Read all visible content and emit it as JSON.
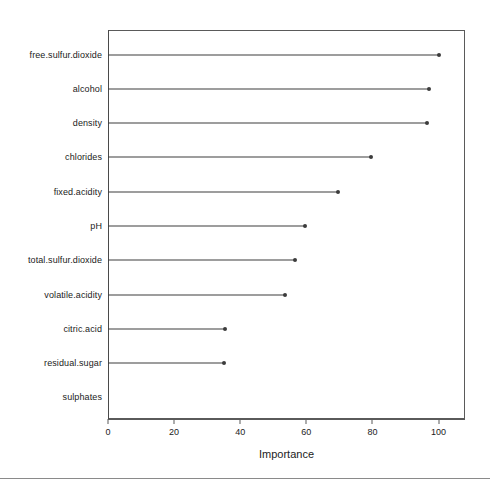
{
  "chart_data": {
    "type": "bar",
    "subtype": "lollipop-dotchart",
    "title": "",
    "xlabel": "Importance",
    "ylabel": "",
    "xlim": [
      0,
      108
    ],
    "xticks": [
      0,
      20,
      40,
      60,
      80,
      100
    ],
    "xticklabels": [
      "0",
      "20",
      "40",
      "60",
      "80",
      "100"
    ],
    "grid": false,
    "legend": null,
    "orientation": "horizontal",
    "categories": [
      "free.sulfur.dioxide",
      "alcohol",
      "density",
      "chlorides",
      "fixed.acidity",
      "pH",
      "total.sulfur.dioxide",
      "volatile.acidity",
      "citric.acid",
      "residual.sugar",
      "sulphates"
    ],
    "values": [
      100,
      97,
      96.5,
      79.5,
      69.5,
      59.5,
      56.5,
      53.5,
      35.5,
      35,
      0
    ],
    "marker": "filled-circle",
    "line_color": "#3c3c3c",
    "marker_color": "#3c3c3c",
    "axis_color": "#5a5a5a"
  }
}
